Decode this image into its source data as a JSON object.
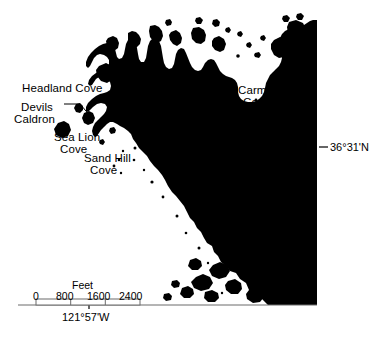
{
  "figure": {
    "type": "map",
    "background_color": "#ffffff",
    "land_color": "#000000",
    "sea_color": "#ffffff",
    "line_color": "#555555"
  },
  "place_labels": [
    {
      "name": "headland-cove",
      "line1": "Headland Cove",
      "line2": ""
    },
    {
      "name": "devils-caldron",
      "line1": "Devils",
      "line2": "Caldron"
    },
    {
      "name": "sea-lion-cove",
      "line1": "Sea Lion",
      "line2": "Cove"
    },
    {
      "name": "sand-hill-cove",
      "line1": "Sand Hill",
      "line2": "Cove"
    },
    {
      "name": "carmelo-cove",
      "line1": "Carmelo",
      "line2": "Cove"
    }
  ],
  "labels": {
    "headland_cove": "Headland Cove",
    "devils": "Devils",
    "caldron": "Caldron",
    "sea_lion": "Sea Lion",
    "sea_lion_cove": "Cove",
    "sand_hill": "Sand Hill",
    "sand_hill_cove": "Cove",
    "carmelo": "Carmelo",
    "carmelo_cove": "Cove"
  },
  "graticule": {
    "latitude_label": "36°31'N",
    "longitude_label": "121°57'W"
  },
  "scale_bar": {
    "units_label": "Feet",
    "ticks": [
      "0",
      "800",
      "1600",
      "2400"
    ],
    "tick_values": [
      0,
      800,
      1600,
      2400
    ],
    "units": "feet"
  }
}
